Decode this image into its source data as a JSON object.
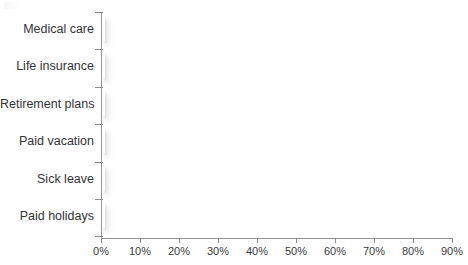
{
  "chart_data": {
    "type": "bar",
    "orientation": "horizontal",
    "title": "",
    "subtitle": "",
    "xlabel": "",
    "ylabel": "",
    "categories": [
      "Medical care",
      "Life insurance",
      "Retirement plans",
      "Paid vacation",
      "Sick leave",
      "Paid holidays"
    ],
    "values": [
      82,
      70.5,
      75,
      81,
      73,
      81
    ],
    "value_unit": "%",
    "xlim": [
      0,
      90
    ],
    "xticks": [
      0,
      10,
      20,
      30,
      40,
      50,
      60,
      70,
      80,
      90
    ],
    "xtick_labels": [
      "0%",
      "10%",
      "20%",
      "30%",
      "40%",
      "50%",
      "60%",
      "70%",
      "80%",
      "90%"
    ],
    "grid": false,
    "legend": false,
    "legend_position": "none",
    "series": [
      {
        "name": "Percent of workers with benefit",
        "values": [
          82,
          70.5,
          75,
          81,
          73,
          81
        ]
      }
    ],
    "colors": {
      "bar_fill": "#dfa87e",
      "bar_border": "#ffffff",
      "axis": "#8f8f93",
      "text": "#333336",
      "background": "#ffffff",
      "shadow": "#787a80"
    }
  },
  "axis": {
    "x_ticks": [
      {
        "label": "0%",
        "value": 0
      },
      {
        "label": "10%",
        "value": 10
      },
      {
        "label": "20%",
        "value": 20
      },
      {
        "label": "30%",
        "value": 30
      },
      {
        "label": "40%",
        "value": 40
      },
      {
        "label": "50%",
        "value": 50
      },
      {
        "label": "60%",
        "value": 60
      },
      {
        "label": "70%",
        "value": 70
      },
      {
        "label": "80%",
        "value": 80
      },
      {
        "label": "90%",
        "value": 90
      }
    ]
  },
  "categories": [
    {
      "label": "Medical care",
      "value": 82
    },
    {
      "label": "Life insurance",
      "value": 70.5
    },
    {
      "label": "Retirement plans",
      "value": 75
    },
    {
      "label": "Paid vacation",
      "value": 81
    },
    {
      "label": "Sick leave",
      "value": 73
    },
    {
      "label": "Paid holidays",
      "value": 81
    }
  ]
}
